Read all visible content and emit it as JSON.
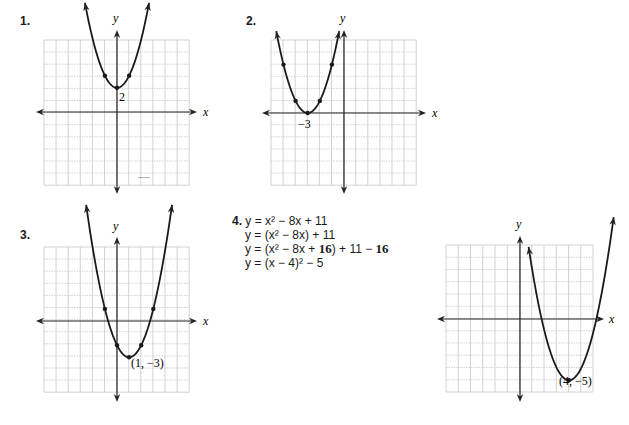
{
  "problems": [
    {
      "number": "1.",
      "number_pos": [
        20,
        14
      ],
      "grid": {
        "x0": 44,
        "y0": 40,
        "cell": 12.1,
        "cols": 12,
        "rows": 12
      },
      "origin": [
        117,
        112
      ],
      "axis_ext": {
        "left": 36,
        "right": 197,
        "top": 30,
        "bottom": 194
      },
      "x_label_pos": [
        203,
        116
      ],
      "y_label_pos": [
        113,
        22
      ],
      "axis_x_label": "x",
      "axis_y_label": "y",
      "curve": {
        "a": 1,
        "h": 0,
        "k": 2,
        "xmin": -2.65,
        "xmax": 2.65
      },
      "points": [
        [
          -1,
          3
        ],
        [
          0,
          2
        ],
        [
          1,
          3
        ]
      ],
      "annotation": {
        "text": "2",
        "pos": [
          119,
          101
        ]
      }
    },
    {
      "number": "2.",
      "number_pos": [
        246,
        14
      ],
      "grid": {
        "x0": 271,
        "y0": 40,
        "cell": 12.1,
        "cols": 12,
        "rows": 12
      },
      "origin": [
        344,
        113
      ],
      "axis_ext": {
        "left": 262,
        "right": 426,
        "top": 30,
        "bottom": 194
      },
      "x_label_pos": [
        432,
        117
      ],
      "y_label_pos": [
        340,
        22
      ],
      "axis_x_label": "x",
      "axis_y_label": "y",
      "curve": {
        "a": 1,
        "h": -3,
        "k": 0,
        "xmin": -5.6,
        "xmax": -0.4
      },
      "points": [
        [
          -5,
          4
        ],
        [
          -4,
          1
        ],
        [
          -3,
          0
        ],
        [
          -2,
          1
        ],
        [
          -1,
          4
        ]
      ],
      "annotation": {
        "text": "−3",
        "pos": [
          298,
          128
        ]
      }
    },
    {
      "number": "3.",
      "number_pos": [
        20,
        228
      ],
      "grid": {
        "x0": 44,
        "y0": 247,
        "cell": 12.1,
        "cols": 12,
        "rows": 12
      },
      "origin": [
        117,
        321
      ],
      "axis_ext": {
        "left": 36,
        "right": 197,
        "top": 237,
        "bottom": 402
      },
      "x_label_pos": [
        203,
        325
      ],
      "y_label_pos": [
        113,
        230
      ],
      "axis_x_label": "x",
      "axis_y_label": "y",
      "curve": {
        "a": 1,
        "h": 1,
        "k": -3,
        "xmin": -2.55,
        "xmax": 4.55
      },
      "points": [
        [
          -1,
          1
        ],
        [
          0,
          -2
        ],
        [
          1,
          -3
        ],
        [
          2,
          -2
        ],
        [
          3,
          1
        ]
      ],
      "annotation": {
        "text": "(1, −3)",
        "pos": [
          131,
          367
        ]
      }
    },
    {
      "number": "4.",
      "number_pos": [
        232,
        214
      ],
      "grid": {
        "x0": 446,
        "y0": 245,
        "cell": 12.25,
        "cols": 12,
        "rows": 12
      },
      "origin": [
        520,
        319
      ],
      "axis_ext": {
        "left": 437,
        "right": 604,
        "top": 236,
        "bottom": 402
      },
      "x_label_pos": [
        609,
        323
      ],
      "y_label_pos": [
        516,
        228
      ],
      "axis_x_label": "x",
      "axis_y_label": "y",
      "curve": {
        "a": 1,
        "h": 4,
        "k": -5,
        "xmin": 0.7,
        "xmax": 7.65
      },
      "points": [
        [
          4,
          -5
        ]
      ],
      "annotation": {
        "text": "(4, −5)",
        "pos": [
          559,
          385
        ]
      }
    }
  ],
  "algebra": {
    "number": "4.",
    "lines": [
      [
        {
          "t": "y = x² − 8x + 11",
          "b": false
        }
      ],
      [
        {
          "t": "y = (x² − 8x) + 11",
          "b": false
        }
      ],
      [
        {
          "t": "y = (x² − 8x + ",
          "b": false
        },
        {
          "t": "16",
          "b": true
        },
        {
          "t": ") + 11 − ",
          "b": false
        },
        {
          "t": "16",
          "b": true
        }
      ],
      [
        {
          "t": "y = (x − 4)² − 5",
          "b": false
        }
      ]
    ]
  },
  "stray_mark": {
    "text": "—",
    "pos": [
      138,
      180
    ]
  },
  "colors": {
    "grid": "#c8c8c8",
    "grid_minor": "#dcdcdc",
    "axis": "#222222",
    "curve": "#1a1a1a"
  }
}
